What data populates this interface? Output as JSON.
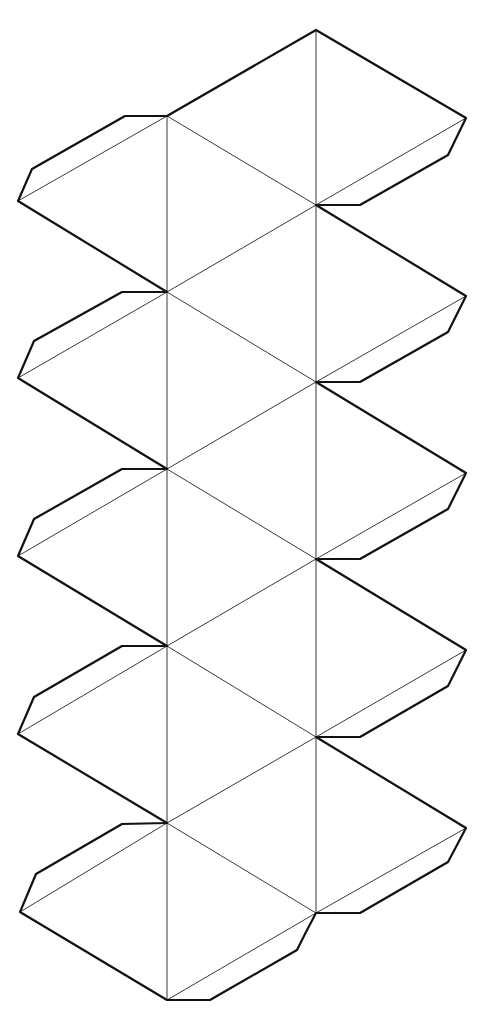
{
  "diagram": {
    "type": "icosahedron-net",
    "faces": 20,
    "glue_tabs": 12,
    "colors": {
      "background": "#ffffff",
      "cut_line": "#111111",
      "fold_line": "#222222"
    },
    "outline_points": [
      [
        316,
        30
      ],
      [
        466,
        118
      ],
      [
        448,
        155
      ],
      [
        360,
        205
      ],
      [
        316,
        205
      ],
      [
        466,
        296
      ],
      [
        448,
        332
      ],
      [
        360,
        382
      ],
      [
        316,
        382
      ],
      [
        466,
        473
      ],
      [
        448,
        509
      ],
      [
        360,
        559
      ],
      [
        316,
        559
      ],
      [
        466,
        650
      ],
      [
        448,
        686
      ],
      [
        360,
        737
      ],
      [
        316,
        737
      ],
      [
        466,
        828
      ],
      [
        448,
        862
      ],
      [
        360,
        913
      ],
      [
        316,
        913
      ],
      [
        306,
        932
      ],
      [
        297,
        950
      ],
      [
        210,
        1000
      ],
      [
        167,
        1000
      ],
      [
        20,
        912
      ],
      [
        36,
        874
      ],
      [
        122,
        824
      ],
      [
        167,
        823
      ],
      [
        18,
        734
      ],
      [
        34,
        697
      ],
      [
        122,
        646
      ],
      [
        167,
        646
      ],
      [
        18,
        556
      ],
      [
        34,
        519
      ],
      [
        122,
        469
      ],
      [
        167,
        469
      ],
      [
        18,
        378
      ],
      [
        34,
        341
      ],
      [
        122,
        292
      ],
      [
        167,
        292
      ],
      [
        18,
        201
      ],
      [
        32,
        169
      ],
      [
        125,
        116
      ],
      [
        167,
        116
      ]
    ],
    "fold_lines": [
      [
        [
          167,
          116
        ],
        [
          167,
          1000
        ]
      ],
      [
        [
          316,
          30
        ],
        [
          316,
          913
        ]
      ],
      [
        [
          167,
          116
        ],
        [
          18,
          201
        ]
      ],
      [
        [
          167,
          292
        ],
        [
          18,
          378
        ]
      ],
      [
        [
          167,
          469
        ],
        [
          18,
          556
        ]
      ],
      [
        [
          167,
          646
        ],
        [
          18,
          734
        ]
      ],
      [
        [
          167,
          823
        ],
        [
          20,
          912
        ]
      ],
      [
        [
          316,
          205
        ],
        [
          466,
          118
        ]
      ],
      [
        [
          316,
          382
        ],
        [
          466,
          296
        ]
      ],
      [
        [
          316,
          559
        ],
        [
          466,
          473
        ]
      ],
      [
        [
          316,
          737
        ],
        [
          466,
          650
        ]
      ],
      [
        [
          316,
          913
        ],
        [
          466,
          828
        ]
      ],
      [
        [
          167,
          1000
        ],
        [
          316,
          913
        ]
      ],
      [
        [
          167,
          116
        ],
        [
          316,
          205
        ]
      ],
      [
        [
          167,
          292
        ],
        [
          316,
          205
        ]
      ],
      [
        [
          167,
          292
        ],
        [
          316,
          382
        ]
      ],
      [
        [
          167,
          469
        ],
        [
          316,
          382
        ]
      ],
      [
        [
          167,
          469
        ],
        [
          316,
          559
        ]
      ],
      [
        [
          167,
          646
        ],
        [
          316,
          559
        ]
      ],
      [
        [
          167,
          646
        ],
        [
          316,
          737
        ]
      ],
      [
        [
          167,
          823
        ],
        [
          316,
          737
        ]
      ],
      [
        [
          167,
          823
        ],
        [
          316,
          913
        ]
      ]
    ]
  }
}
